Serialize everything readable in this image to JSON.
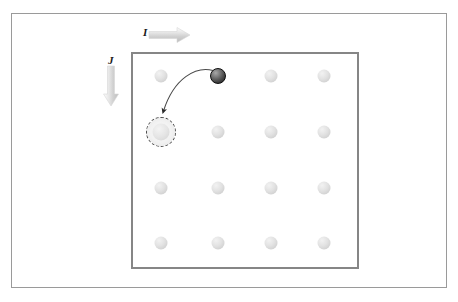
{
  "figure": {
    "background_color": "#ffffff",
    "width": 458,
    "height": 302
  },
  "outer_frame": {
    "name": "outer-frame",
    "border_color": "#9a9a9a"
  },
  "lattice_box": {
    "name": "lattice-box",
    "border_color": "#868686",
    "x": 131,
    "y": 52,
    "width": 228,
    "height": 217
  },
  "axes": {
    "horizontal": {
      "label": "I",
      "direction": "right",
      "arrow_color": "#c9c9c9"
    },
    "vertical": {
      "label": "J",
      "direction": "down",
      "arrow_color": "#c9c9c9"
    }
  },
  "chart_data": {
    "type": "scatter",
    "xlabel": "I",
    "ylabel": "J",
    "grid": false,
    "legend": "none",
    "columns": 4,
    "rows": 4,
    "lattice_sites": [
      {
        "row": 1,
        "col": 1,
        "x": 161,
        "y": 76,
        "state": "occupied"
      },
      {
        "row": 1,
        "col": 2,
        "x": 218,
        "y": 76,
        "state": "migrating-atom"
      },
      {
        "row": 1,
        "col": 3,
        "x": 271,
        "y": 76,
        "state": "occupied"
      },
      {
        "row": 1,
        "col": 4,
        "x": 324,
        "y": 76,
        "state": "occupied"
      },
      {
        "row": 2,
        "col": 1,
        "x": 161,
        "y": 132,
        "state": "vacancy"
      },
      {
        "row": 2,
        "col": 2,
        "x": 218,
        "y": 132,
        "state": "occupied"
      },
      {
        "row": 2,
        "col": 3,
        "x": 271,
        "y": 132,
        "state": "occupied"
      },
      {
        "row": 2,
        "col": 4,
        "x": 324,
        "y": 132,
        "state": "occupied"
      },
      {
        "row": 3,
        "col": 1,
        "x": 161,
        "y": 188,
        "state": "occupied"
      },
      {
        "row": 3,
        "col": 2,
        "x": 218,
        "y": 188,
        "state": "occupied"
      },
      {
        "row": 3,
        "col": 3,
        "x": 271,
        "y": 188,
        "state": "occupied"
      },
      {
        "row": 3,
        "col": 4,
        "x": 324,
        "y": 188,
        "state": "occupied"
      },
      {
        "row": 4,
        "col": 1,
        "x": 161,
        "y": 243,
        "state": "occupied"
      },
      {
        "row": 4,
        "col": 2,
        "x": 218,
        "y": 243,
        "state": "occupied"
      },
      {
        "row": 4,
        "col": 3,
        "x": 271,
        "y": 243,
        "state": "occupied"
      },
      {
        "row": 4,
        "col": 4,
        "x": 324,
        "y": 243,
        "state": "occupied"
      }
    ],
    "annotations": [
      {
        "type": "curved-arrow",
        "name": "hop-trajectory",
        "from": {
          "row": 1,
          "col": 2,
          "x": 218,
          "y": 76
        },
        "to": {
          "row": 2,
          "col": 1,
          "x": 161,
          "y": 132
        },
        "color": "#4a4a4a"
      },
      {
        "type": "axis-arrow",
        "label": "I",
        "direction": "right"
      },
      {
        "type": "axis-arrow",
        "label": "J",
        "direction": "down"
      }
    ],
    "colors": {
      "occupied_site": "#dcdcdc",
      "migrating_atom": "#3a3a3a",
      "vacancy_ring": "#4a4a4a",
      "lattice_border": "#868686",
      "outer_border": "#9a9a9a",
      "axis_arrow": "#c9c9c9"
    }
  }
}
